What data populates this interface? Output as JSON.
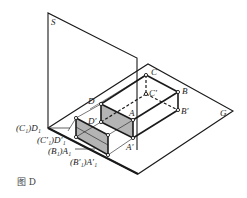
{
  "figure": {
    "caption": "图 D",
    "planes": {
      "vertical": "S",
      "horizontal": "G"
    },
    "points": {
      "C": "C",
      "B": "B",
      "A": "A",
      "D": "D",
      "C_prime": "C′",
      "B_prime": "B′",
      "A_prime": "A′",
      "D_prime": "D′"
    },
    "projection_labels": {
      "c1d1": "(C₁)D₁",
      "c1pd1p": "(C′₁)D′₁",
      "b1a1": "(B₁)A₁",
      "b1pa1p": "(B′₁)A′₁"
    },
    "colors": {
      "line": "#1a1a1a",
      "shade": "#b4b4b4",
      "background": "#ffffff"
    }
  }
}
